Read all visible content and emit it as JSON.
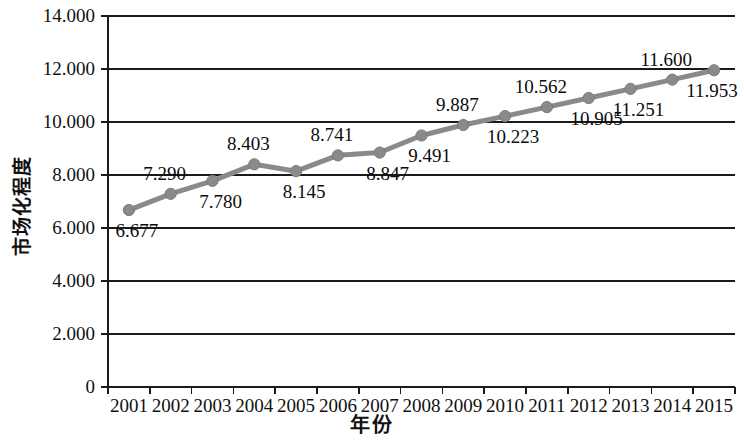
{
  "chart_data": {
    "type": "line",
    "title": "",
    "xlabel": "年份",
    "ylabel": "市场化程度",
    "categories": [
      "2001",
      "2002",
      "2003",
      "2004",
      "2005",
      "2006",
      "2007",
      "2008",
      "2009",
      "2010",
      "2011",
      "2012",
      "2013",
      "2014",
      "2015"
    ],
    "values": [
      6.677,
      7.29,
      7.78,
      8.403,
      8.145,
      8.741,
      8.847,
      9.491,
      9.887,
      10.223,
      10.562,
      10.905,
      11.251,
      11.6,
      11.953
    ],
    "point_labels": [
      "6.677",
      "7.290",
      "7.780",
      "8.403",
      "8.145",
      "8.741",
      "8.847",
      "9.491",
      "9.887",
      "10.223",
      "10.562",
      "10.905",
      "11.251",
      "11.600",
      "11.953"
    ],
    "label_positions": [
      "below",
      "above",
      "below",
      "above",
      "below",
      "above",
      "below",
      "below",
      "above",
      "below",
      "above",
      "below",
      "below",
      "above",
      "below"
    ],
    "ytick_labels": [
      "14.000",
      "12.000",
      "10.000",
      "8.000",
      "6.000",
      "4.000",
      "2.000",
      "0"
    ],
    "ytick_values": [
      14,
      12,
      10,
      8,
      6,
      4,
      2,
      0
    ],
    "ylim": [
      0,
      14
    ],
    "grid": true,
    "legend": "none",
    "series_color": "#8a8a8a",
    "axis_color": "#1a1a1a",
    "marker": "circle"
  }
}
